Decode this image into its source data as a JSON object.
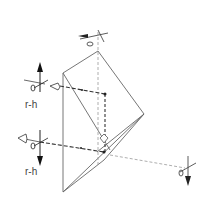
{
  "diagram": {
    "type": "prism-optics-sketch",
    "labels": {
      "upper_left": "r-h",
      "lower_left": "r-h"
    },
    "eye_symbols": {
      "upper_left": "eye-o",
      "lower_left": "eye-o",
      "top": "eye-o",
      "bottom_right": "eye-o"
    },
    "colors": {
      "line": "#555555",
      "dashed": "#888888",
      "arrow": "#222222"
    }
  }
}
